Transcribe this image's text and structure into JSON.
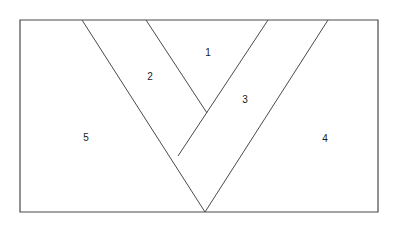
{
  "figure": {
    "type": "geometry-diagram",
    "canvas": {
      "width": 398,
      "height": 226
    },
    "background_color": "#ffffff",
    "stroke_color": "#4a4a4a",
    "label_color": "#1a1a1a",
    "stroke_width": 1,
    "rectangle": {
      "name": "outer-rectangle",
      "x": 20,
      "y": 20,
      "width": 358,
      "height": 192,
      "points": "20,20 378,20 378,212 20,212"
    },
    "vertices": {
      "bottom_apex": {
        "x": 205,
        "y": 212
      },
      "inner_apex": {
        "x": 207,
        "y": 113
      },
      "left_junction": {
        "x": 178,
        "y": 156
      },
      "top_outer_left": {
        "x": 82,
        "y": 20
      },
      "top_inner_left": {
        "x": 146,
        "y": 20
      },
      "top_inner_right": {
        "x": 268,
        "y": 20
      },
      "top_outer_right": {
        "x": 328,
        "y": 20
      }
    },
    "lines": [
      {
        "name": "outer-v-left-arm",
        "from": {
          "x": 82,
          "y": 20
        },
        "to": {
          "x": 205,
          "y": 212
        }
      },
      {
        "name": "inner-v-left-arm",
        "from": {
          "x": 146,
          "y": 20
        },
        "to": {
          "x": 207,
          "y": 113
        }
      },
      {
        "name": "inner-v-right-arm",
        "from": {
          "x": 268,
          "y": 20
        },
        "to": {
          "x": 178,
          "y": 156
        }
      },
      {
        "name": "outer-v-right-arm",
        "from": {
          "x": 328,
          "y": 20
        },
        "to": {
          "x": 205,
          "y": 212
        }
      }
    ],
    "regions": [
      {
        "name": "region-1",
        "label": "1",
        "label_x": 208,
        "label_y": 53
      },
      {
        "name": "region-2",
        "label": "2",
        "label_x": 150,
        "label_y": 77
      },
      {
        "name": "region-3",
        "label": "3",
        "label_x": 245,
        "label_y": 100
      },
      {
        "name": "region-4",
        "label": "4",
        "label_x": 325,
        "label_y": 139
      },
      {
        "name": "region-5",
        "label": "5",
        "label_x": 86,
        "label_y": 138
      }
    ]
  }
}
